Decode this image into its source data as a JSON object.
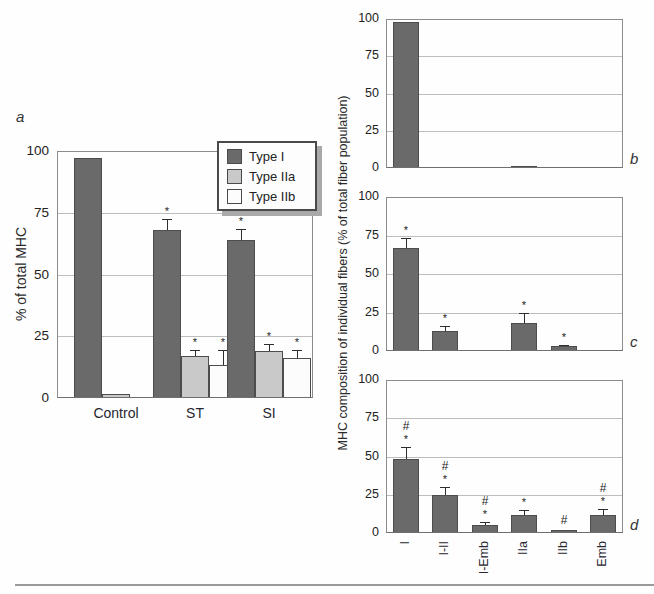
{
  "panel_labels": {
    "a": "a",
    "b": "b",
    "c": "c",
    "d": "d"
  },
  "colors": {
    "type1_fill": "#6a6a6a",
    "type2a_fill": "#c9c9c9",
    "type2b_fill": "#fcfcfc",
    "bar_border": "#4d4d4d",
    "gridline": "#bdbdbd",
    "frame": "#8c8c8c",
    "axis": "#6f6f6f",
    "error_bar": "#2e2e2e",
    "text": "#222222"
  },
  "chart_data": [
    {
      "id": "a",
      "type": "bar",
      "title": "",
      "xlabel": "",
      "ylabel": "% of total MHC",
      "ylim": [
        0,
        100
      ],
      "yticks": [
        0,
        25,
        50,
        75,
        100
      ],
      "grid": "horizontal",
      "categories": [
        "Control",
        "ST",
        "SI"
      ],
      "series": [
        {
          "name": "Type I",
          "values": [
            97,
            68,
            64
          ],
          "errors": [
            0,
            4.5,
            4.5
          ],
          "sig": [
            "",
            "*",
            "*"
          ]
        },
        {
          "name": "Type IIa",
          "values": [
            1.5,
            17,
            19
          ],
          "errors": [
            0,
            2.5,
            3
          ],
          "sig": [
            "",
            "*",
            "*"
          ]
        },
        {
          "name": "Type IIb",
          "values": [
            0,
            13.5,
            16
          ],
          "errors": [
            0,
            6,
            3.5
          ],
          "sig": [
            "",
            "*",
            "*"
          ]
        }
      ],
      "legend": {
        "position": "top-right",
        "entries": [
          "Type I",
          "Type IIa",
          "Type IIb"
        ]
      }
    },
    {
      "id": "b",
      "type": "bar",
      "title": "",
      "xlabel": "",
      "ylabel": "MHC composition of individual fibers (% of total fiber population)",
      "ylabel_note": "shared by panels b, c and d",
      "ylim": [
        0,
        100
      ],
      "yticks": [
        0,
        25,
        50,
        75,
        100
      ],
      "grid": "horizontal",
      "categories": [
        "I",
        "I-II",
        "I-Emb",
        "IIa",
        "IIb",
        "Emb"
      ],
      "values": [
        98,
        0,
        0,
        1,
        0,
        0
      ],
      "errors": [
        0,
        0,
        0,
        0,
        0,
        0
      ],
      "sig": [
        "",
        "",
        "",
        "",
        "",
        ""
      ]
    },
    {
      "id": "c",
      "type": "bar",
      "title": "",
      "xlabel": "",
      "ylabel": "",
      "ylim": [
        0,
        100
      ],
      "yticks": [
        0,
        25,
        50,
        75,
        100
      ],
      "grid": "horizontal",
      "categories": [
        "I",
        "I-II",
        "I-Emb",
        "IIa",
        "IIb",
        "Emb"
      ],
      "values": [
        67,
        13,
        0,
        18,
        3,
        0
      ],
      "errors": [
        6.5,
        3,
        0,
        7,
        1,
        0
      ],
      "sig": [
        "*",
        "*",
        "",
        "*",
        "*",
        ""
      ]
    },
    {
      "id": "d",
      "type": "bar",
      "title": "",
      "xlabel": "",
      "ylabel": "",
      "ylim": [
        0,
        100
      ],
      "yticks": [
        0,
        25,
        50,
        75,
        100
      ],
      "grid": "horizontal",
      "categories": [
        "I",
        "I-II",
        "I-Emb",
        "IIa",
        "IIb",
        "Emb"
      ],
      "values": [
        48.5,
        25,
        5,
        11.5,
        2,
        11.5
      ],
      "errors": [
        8,
        5,
        2,
        3.5,
        0,
        4.5
      ],
      "sig": [
        "#*",
        "#*",
        "#*",
        "*",
        "#",
        "#*"
      ]
    }
  ]
}
